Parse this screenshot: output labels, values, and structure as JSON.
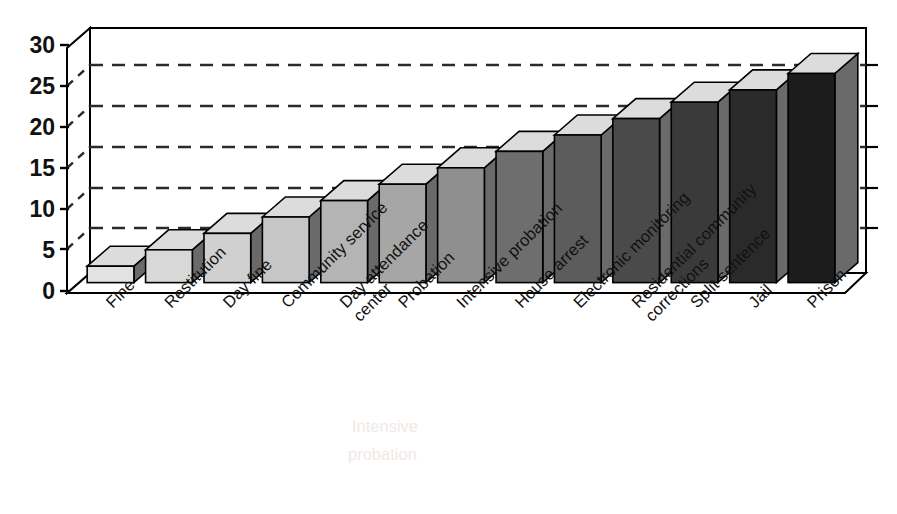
{
  "chart_data": {
    "type": "bar",
    "title": "",
    "subtitle": "",
    "xlabel": "",
    "ylabel": "",
    "categories": [
      "Fine",
      "Restitution",
      "Day fine",
      "Community service",
      "Day attendance center",
      "Probation",
      "Intensive probation",
      "House arrest",
      "Electronic monitoring",
      "Residential community corrections",
      "Split sentence",
      "Jail",
      "Prison"
    ],
    "category_lines": [
      [
        "Fine"
      ],
      [
        "Restitution"
      ],
      [
        "Day fine"
      ],
      [
        "Community service"
      ],
      [
        "Day attendance",
        "center"
      ],
      [
        "Probation"
      ],
      [
        "Intensive probation"
      ],
      [
        "House arrest"
      ],
      [
        "Electronic monitoring"
      ],
      [
        "Residential community",
        "corrections"
      ],
      [
        "Split sentence"
      ],
      [
        "Jail"
      ],
      [
        "Prison"
      ]
    ],
    "values": [
      2,
      4,
      6,
      8,
      10,
      12,
      14,
      16,
      18,
      20,
      22,
      23.5,
      25.5
    ],
    "ylim": [
      0,
      30
    ],
    "yticks": [
      0,
      5,
      10,
      15,
      20,
      25,
      30
    ],
    "ytick_labels": [
      "0",
      "5",
      "10",
      "15",
      "20",
      "25",
      "30"
    ],
    "gridlines": [
      5,
      10,
      15,
      20,
      25
    ],
    "grid": "dashed-horizontal-back-wall",
    "legend": "none",
    "legend_position": "none",
    "style": "3d-perspective-bar",
    "bar_shading_note": "front faces darken progressively from light gray to near black; top faces light gray",
    "bar_front_colors": [
      "#e3e3e3",
      "#d8d8d8",
      "#d0d0d0",
      "#c6c6c6",
      "#b4b4b4",
      "#a6a6a6",
      "#8f8f8f",
      "#6e6e6e",
      "#5c5c5c",
      "#4a4a4a",
      "#3a3a3a",
      "#2a2a2a",
      "#1c1c1c"
    ],
    "bar_top_color": "#dcdcdc",
    "bar_side_color_dark": "#6a6a6a",
    "axis_color": "#000000",
    "gridline_color": "#2b2b2b",
    "background_color": "#ffffff"
  },
  "ghost_text": {
    "line1": "Intensive",
    "line2": "probation"
  }
}
